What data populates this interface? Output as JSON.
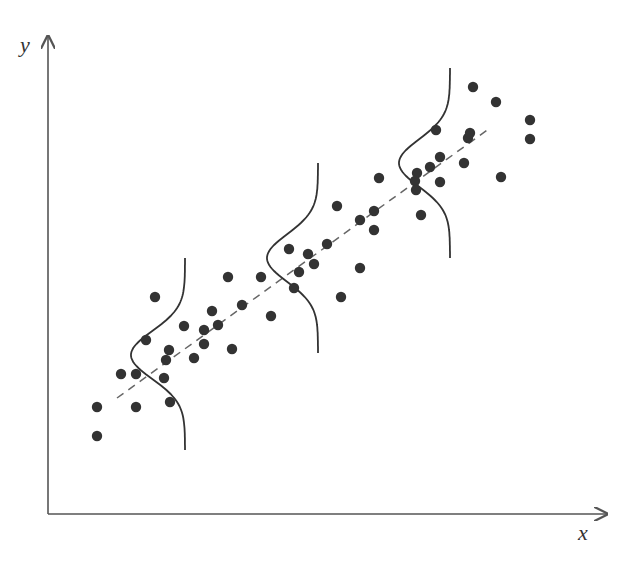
{
  "chart_data": {
    "type": "scatter",
    "title": "",
    "xlabel": "x",
    "ylabel": "y",
    "grid": false,
    "legend": null,
    "colors": {
      "axis": "#555555",
      "points": "#333333",
      "regression_line": "#666666",
      "gaussian": "#333333"
    },
    "axes_pixel": {
      "origin": [
        48,
        514
      ],
      "x_end": [
        607,
        514
      ],
      "y_end": [
        48,
        36
      ]
    },
    "points_pixel": [
      [
        97,
        407
      ],
      [
        97,
        436
      ],
      [
        121,
        374
      ],
      [
        136,
        374
      ],
      [
        136,
        407
      ],
      [
        155,
        297
      ],
      [
        146,
        340
      ],
      [
        169,
        350
      ],
      [
        166,
        360
      ],
      [
        164,
        378
      ],
      [
        170,
        402
      ],
      [
        184,
        326
      ],
      [
        194,
        358
      ],
      [
        204,
        344
      ],
      [
        204,
        330
      ],
      [
        212,
        311
      ],
      [
        218,
        325
      ],
      [
        228,
        277
      ],
      [
        232,
        349
      ],
      [
        242,
        305
      ],
      [
        261,
        277
      ],
      [
        271,
        316
      ],
      [
        289,
        249
      ],
      [
        294,
        288
      ],
      [
        299,
        272
      ],
      [
        308,
        254
      ],
      [
        314,
        264
      ],
      [
        327,
        244
      ],
      [
        337,
        206
      ],
      [
        341,
        297
      ],
      [
        360,
        220
      ],
      [
        360,
        268
      ],
      [
        374,
        230
      ],
      [
        374,
        211
      ],
      [
        379,
        178
      ],
      [
        417,
        173
      ],
      [
        415,
        181
      ],
      [
        416,
        190
      ],
      [
        421,
        215
      ],
      [
        430,
        167
      ],
      [
        440,
        182
      ],
      [
        440,
        157
      ],
      [
        436,
        130
      ],
      [
        464,
        163
      ],
      [
        468,
        138
      ],
      [
        470,
        133
      ],
      [
        473,
        87
      ],
      [
        496,
        102
      ],
      [
        501,
        177
      ],
      [
        530,
        120
      ],
      [
        530,
        139
      ]
    ],
    "regression_line_pixel": {
      "from": [
        117,
        398
      ],
      "to": [
        490,
        128
      ],
      "style": "dashed"
    },
    "gaussian_curves_pixel": [
      {
        "baseline_x": 185,
        "top_y": 258,
        "bottom_y": 450,
        "peak_x": 131,
        "peak_y": 355
      },
      {
        "baseline_x": 318,
        "top_y": 163,
        "bottom_y": 353,
        "peak_x": 267,
        "peak_y": 258
      },
      {
        "baseline_x": 450,
        "top_y": 68,
        "bottom_y": 258,
        "peak_x": 399,
        "peak_y": 163
      }
    ],
    "annotations": [
      "Conditional normal distributions of y given x along a linear regression line"
    ]
  },
  "labels": {
    "x": "x",
    "y": "y"
  }
}
